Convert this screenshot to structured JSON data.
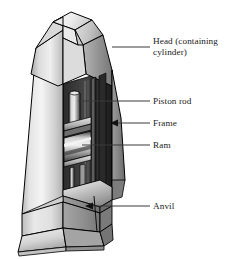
{
  "figure": {
    "type": "technical-cutaway-illustration",
    "background_color": "#ffffff",
    "line_color": "#000000",
    "labels": [
      {
        "id": "head",
        "text": "Head (containing\ncylinder)",
        "text_line1": "Head (containing",
        "text_line2": "cylinder)",
        "x": 153,
        "y": 41,
        "leader": {
          "type": "line",
          "x1": 112,
          "y1": 47,
          "x2": 150,
          "y2": 47
        }
      },
      {
        "id": "piston-rod",
        "text": "Piston rod",
        "x": 153,
        "y": 96,
        "leader": {
          "type": "line",
          "x1": 78,
          "y1": 101,
          "x2": 150,
          "y2": 101
        }
      },
      {
        "id": "frame",
        "text": "Frame",
        "x": 153,
        "y": 118,
        "leader": {
          "type": "arrow-left",
          "x1": 150,
          "y1": 123,
          "x2": 112,
          "y2": 123
        }
      },
      {
        "id": "ram",
        "text": "Ram",
        "x": 153,
        "y": 140,
        "leader": {
          "type": "line",
          "x1": 82,
          "y1": 145,
          "x2": 150,
          "y2": 145
        }
      },
      {
        "id": "anvil",
        "text": "Anvil",
        "x": 153,
        "y": 201,
        "leader": {
          "type": "arrow-left",
          "x1": 150,
          "y1": 206,
          "x2": 87,
          "y2": 206
        }
      }
    ],
    "palette": {
      "top_facet_light": "#ededed",
      "top_facet_mid": "#d2d2d2",
      "left_face_light": "#f2f2f2",
      "left_face_mid": "#c6c6c6",
      "right_face_dark": "#8c8c8c",
      "right_face_darker": "#6e6e6e",
      "cavity_dark": "#3a3a3a",
      "cavity_black": "#111111",
      "ram_highlight": "#e8e8e8",
      "ram_shadow": "#4a4a4a",
      "outline": "#000000"
    },
    "parts": [
      {
        "name": "head",
        "description": "Upper tapered block containing the cylinder"
      },
      {
        "name": "piston-rod",
        "description": "Vertical cylinder inside the cavity"
      },
      {
        "name": "frame",
        "description": "Outer C-shaped tapered body"
      },
      {
        "name": "ram",
        "description": "Horizontal sliding block below the piston rod"
      },
      {
        "name": "anvil",
        "description": "Base block at the bottom of the cavity"
      }
    ]
  }
}
